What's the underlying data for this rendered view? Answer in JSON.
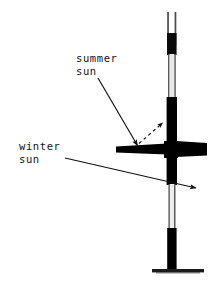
{
  "diagram": {
    "background_color": "#ffffff",
    "ink_color": "#000000",
    "labels": {
      "summer": {
        "line1": "summer",
        "line2": "sun"
      },
      "winter": {
        "line1": "winter",
        "line2": "sun"
      }
    },
    "structure": {
      "post_name": "vertical-post",
      "crossbar_name": "horizontal-crossbar",
      "base_name": "base-plate"
    },
    "arrows": {
      "summer_incoming": "summer-sun-ray",
      "summer_reflected": "summer-sun-reflected-ray",
      "winter_incoming": "winter-sun-ray"
    }
  }
}
